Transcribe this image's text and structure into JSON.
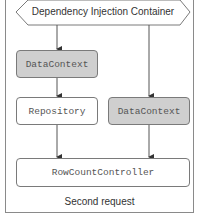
{
  "diagram": {
    "container": {
      "label": "Dependency Injection Container",
      "shape": "hexagon"
    },
    "nodes": [
      {
        "id": "datacontext-left",
        "label": "DataContext",
        "fill": "#cfcfcf"
      },
      {
        "id": "repository",
        "label": "Repository",
        "fill": "#ffffff"
      },
      {
        "id": "datacontext-right",
        "label": "DataContext",
        "fill": "#cfcfcf"
      },
      {
        "id": "rowcountcontroller",
        "label": "RowCountController",
        "fill": "#ffffff"
      }
    ],
    "edges": [
      {
        "from": "container",
        "to": "datacontext-left"
      },
      {
        "from": "datacontext-left",
        "to": "repository"
      },
      {
        "from": "container",
        "to": "datacontext-right"
      },
      {
        "from": "repository",
        "to": "rowcountcontroller"
      },
      {
        "from": "datacontext-right",
        "to": "rowcountcontroller"
      }
    ],
    "caption": "Second request"
  },
  "colors": {
    "border": "#7a7a7a",
    "gray_fill": "#cfcfcf",
    "text": "#333333"
  }
}
